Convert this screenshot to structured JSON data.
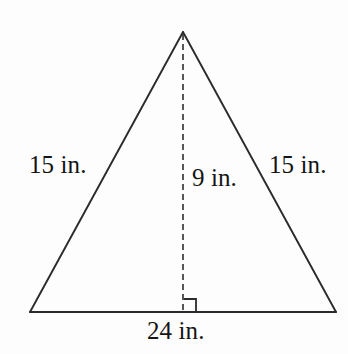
{
  "figure": {
    "kind": "isosceles-triangle-with-altitude",
    "unit": "in.",
    "stroke_color": "#2b2b2b",
    "dash_color": "#3a3a3a",
    "background_color": "#fdfdfd",
    "text_color": "#141414",
    "vertices": {
      "apex": [
        183,
        32
      ],
      "bottom_left": [
        30,
        312
      ],
      "bottom_right": [
        336,
        312
      ],
      "altitude_foot": [
        183,
        312
      ]
    },
    "right_angle_marker": {
      "size": 13,
      "corner": [
        183,
        312
      ],
      "opens": "right"
    },
    "altitude": {
      "dashed": true,
      "dash_on": 6,
      "dash_off": 4
    }
  },
  "labels": {
    "left_side": "15 in.",
    "right_side": "15 in.",
    "altitude": "9 in.",
    "base": "24 in."
  },
  "measurements": {
    "leg_left": 15,
    "leg_right": 15,
    "height": 9,
    "base": 24
  }
}
